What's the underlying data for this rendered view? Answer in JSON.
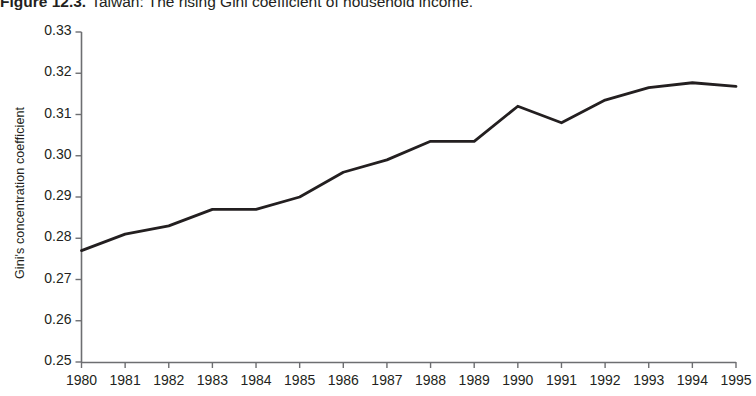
{
  "figure": {
    "number": "Figure 12.3.",
    "caption": "Taiwan: The rising Gini coefficient of household income."
  },
  "chart_data": {
    "type": "line",
    "title": "Taiwan: The rising Gini coefficient of household income.",
    "xlabel": "",
    "ylabel": "Gini's concentration coefficient",
    "x": [
      1980,
      1981,
      1982,
      1983,
      1984,
      1985,
      1986,
      1987,
      1988,
      1989,
      1990,
      1991,
      1992,
      1993,
      1994,
      1995
    ],
    "categories": [
      "1980",
      "1981",
      "1982",
      "1983",
      "1984",
      "1985",
      "1986",
      "1987",
      "1988",
      "1989",
      "1990",
      "1991",
      "1992",
      "1993",
      "1994",
      "1995"
    ],
    "values": [
      0.277,
      0.281,
      0.283,
      0.287,
      0.287,
      0.29,
      0.296,
      0.299,
      0.3035,
      0.3035,
      0.312,
      0.308,
      0.3135,
      0.3165,
      0.3177,
      0.3168
    ],
    "series": [
      {
        "name": "Gini's concentration coefficient",
        "values": [
          0.277,
          0.281,
          0.283,
          0.287,
          0.287,
          0.29,
          0.296,
          0.299,
          0.3035,
          0.3035,
          0.312,
          0.308,
          0.3135,
          0.3165,
          0.3177,
          0.3168
        ]
      }
    ],
    "ylim": [
      0.25,
      0.33
    ],
    "yticks": [
      0.25,
      0.26,
      0.27,
      0.28,
      0.29,
      0.3,
      0.31,
      0.32,
      0.33
    ],
    "ytick_labels": [
      "0.25",
      "0.26",
      "0.27",
      "0.28",
      "0.29",
      "0.30",
      "0.31",
      "0.32",
      "0.33"
    ],
    "xlim": [
      1980,
      1995
    ],
    "grid": false,
    "legend": "none",
    "line_color": "#231f20",
    "axis_color": "#6d6e71"
  }
}
